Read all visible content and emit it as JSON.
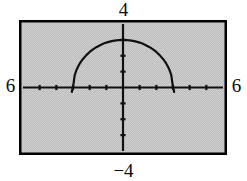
{
  "figure": {
    "name": "graphing-calculator-screen",
    "background_color": "#ffffff",
    "screen_fill": "#c9c9c9",
    "border_color": "#000000",
    "ink_color": "#111111"
  },
  "window_labels": {
    "ymax": "4",
    "ymin": "−4",
    "xmin": "6",
    "xmax": "6"
  },
  "chart_data": {
    "type": "line",
    "title": "",
    "subtitle": "",
    "xlabel": "",
    "ylabel": "",
    "grid": false,
    "legend": null,
    "legend_position": "none",
    "axis_style": "calculator-window-with-tick-marks",
    "xlim": [
      -6,
      6
    ],
    "ylim": [
      -4,
      4
    ],
    "xticks": [
      -6,
      -5,
      -4,
      -3,
      -2,
      -1,
      0,
      1,
      2,
      3,
      4,
      5,
      6
    ],
    "yticks": [
      -4,
      -3,
      -2,
      -1,
      0,
      1,
      2,
      3,
      4
    ],
    "xtick_labels": [
      "",
      "",
      "",
      "",
      "",
      "",
      "",
      "",
      "",
      "",
      "",
      "",
      ""
    ],
    "ytick_labels": [
      "",
      "",
      "",
      "",
      "",
      "",
      "",
      "",
      ""
    ],
    "annotations": [],
    "series": [
      {
        "name": "upper semicircle",
        "description": "y = sqrt(9 - x^2), upper half of circle of radius 3 centered at origin",
        "x": [
          -3.0,
          -2.9,
          -2.8,
          -2.7,
          -2.6,
          -2.5,
          -2.4,
          -2.2,
          -2.0,
          -1.8,
          -1.6,
          -1.4,
          -1.2,
          -1.0,
          -0.8,
          -0.6,
          -0.4,
          -0.2,
          0.0,
          0.2,
          0.4,
          0.6,
          0.8,
          1.0,
          1.2,
          1.4,
          1.6,
          1.8,
          2.0,
          2.2,
          2.4,
          2.5,
          2.6,
          2.7,
          2.8,
          2.9,
          3.0
        ],
        "y": [
          0.0,
          0.77,
          1.08,
          1.31,
          1.5,
          1.66,
          1.8,
          2.04,
          2.24,
          2.4,
          2.54,
          2.65,
          2.75,
          2.83,
          2.89,
          2.94,
          2.97,
          2.99,
          3.0,
          2.99,
          2.97,
          2.94,
          2.89,
          2.83,
          2.75,
          2.65,
          2.54,
          2.4,
          2.24,
          2.04,
          1.8,
          1.66,
          1.5,
          1.31,
          1.08,
          0.77,
          0.0
        ]
      }
    ]
  }
}
